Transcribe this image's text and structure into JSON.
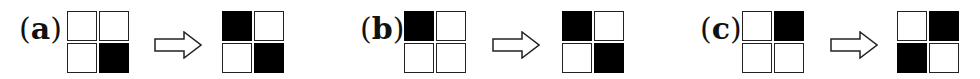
{
  "figure": {
    "panels": [
      {
        "label": "a",
        "before": [
          [
            0,
            0
          ],
          [
            0,
            1
          ]
        ],
        "after": [
          [
            1,
            0
          ],
          [
            0,
            1
          ]
        ]
      },
      {
        "label": "b",
        "before": [
          [
            1,
            0
          ],
          [
            0,
            0
          ]
        ],
        "after": [
          [
            1,
            0
          ],
          [
            0,
            1
          ]
        ]
      },
      {
        "label": "c",
        "before": [
          [
            0,
            1
          ],
          [
            0,
            0
          ]
        ],
        "after": [
          [
            0,
            1
          ],
          [
            1,
            0
          ]
        ]
      }
    ],
    "arrow_symbol": "right-hollow-arrow",
    "colors": {
      "filled": "#000000",
      "empty": "#ffffff",
      "stroke": "#222222"
    }
  }
}
